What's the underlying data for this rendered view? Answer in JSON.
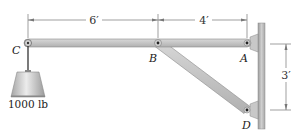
{
  "diagram": {
    "type": "statics-frame",
    "dimensions": {
      "cb": "6′",
      "ba": "4′",
      "ad": "3′"
    },
    "points": {
      "c": "C",
      "b": "B",
      "a": "A",
      "d": "D"
    },
    "load": {
      "label": "1000 lb"
    },
    "colors": {
      "member_fill": "#c9c9c9",
      "member_stroke": "#8a8a8a",
      "wall": "#b5b5b5",
      "weight_light": "#e6e6e6",
      "weight_dark": "#9a9a9a",
      "dim_line": "#666666"
    }
  }
}
